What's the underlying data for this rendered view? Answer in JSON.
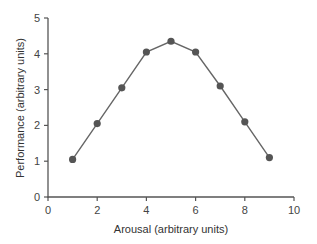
{
  "chart_data": {
    "type": "line",
    "title": "",
    "xlabel": "Arousal (arbitrary units)",
    "ylabel": "Performance (arbitrary units)",
    "xlim": [
      0,
      10
    ],
    "ylim": [
      0,
      5
    ],
    "xticks": [
      0,
      2,
      4,
      6,
      8,
      10
    ],
    "yticks": [
      0,
      1,
      2,
      3,
      4,
      5
    ],
    "grid": false,
    "legend": null,
    "series": [
      {
        "name": "Performance",
        "x": [
          1,
          2,
          3,
          4,
          5,
          6,
          7,
          8,
          9
        ],
        "values": [
          1.05,
          2.05,
          3.05,
          4.05,
          4.35,
          4.05,
          3.1,
          2.1,
          1.1
        ],
        "marker": "circle",
        "color": "#555555"
      }
    ]
  },
  "colors": {
    "axis": "#555555",
    "line": "#666666",
    "marker": "#555555",
    "text": "#444444"
  }
}
